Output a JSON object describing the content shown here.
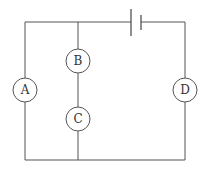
{
  "diagram": {
    "type": "circuit",
    "components": [
      {
        "id": "battery",
        "kind": "cell",
        "position": "top-wire"
      },
      {
        "id": "A",
        "label": "A",
        "kind": "circle-component",
        "branch": "left"
      },
      {
        "id": "B",
        "label": "B",
        "kind": "circle-component",
        "branch": "middle-upper"
      },
      {
        "id": "C",
        "label": "C",
        "kind": "circle-component",
        "branch": "middle-lower"
      },
      {
        "id": "D",
        "label": "D",
        "kind": "circle-component",
        "branch": "right"
      }
    ],
    "labels": {
      "a": "A",
      "b": "B",
      "c": "C",
      "d": "D"
    },
    "colors": {
      "wire": "#555555",
      "background": "#ffffff"
    }
  }
}
